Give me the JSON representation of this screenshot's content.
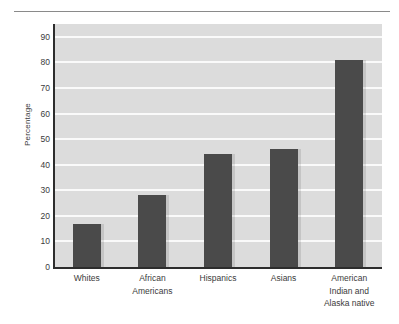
{
  "chart_data": {
    "type": "bar",
    "title": "",
    "subtitle": "",
    "xlabel": "",
    "ylabel": "Percentage",
    "categories": [
      "Whites",
      "African\nAmericans",
      "Hispanics",
      "Asians",
      "American\nIndian and\nAlaska native"
    ],
    "values": [
      17,
      28,
      44,
      46,
      81
    ],
    "ylim": [
      0,
      95
    ],
    "yticks": [
      0,
      10,
      20,
      30,
      40,
      50,
      60,
      70,
      80,
      90
    ],
    "ytick_labels": [
      "0",
      "10",
      "20",
      "30",
      "40",
      "50",
      "60",
      "70",
      "80",
      "90"
    ],
    "grid": true,
    "grid_axis": "y",
    "legend": null,
    "legend_position": "none",
    "colors": {
      "bar": "#4a4a4a",
      "plot_background": "#dcdcdc",
      "gridline": "#fafafa",
      "axis": "#2d2d2d",
      "text": "#3b3b3b",
      "rule": "#8a8a8a",
      "figure_background": "#ffffff"
    }
  }
}
